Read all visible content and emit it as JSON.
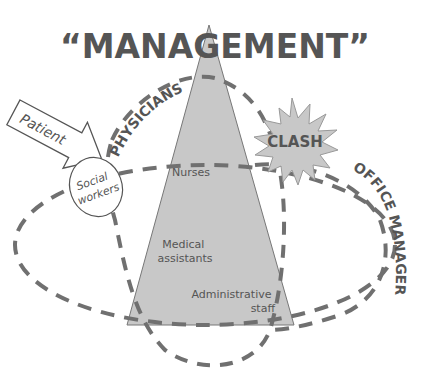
{
  "diagram": {
    "title": "“MANAGEMENT”",
    "pyramid": {
      "levels": [
        "Nurses",
        "Medical assistants",
        "Administrative staff"
      ],
      "level_lines": [
        [
          "Nurses"
        ],
        [
          "Medical",
          "assistants"
        ],
        [
          "Administrative",
          "staff"
        ]
      ],
      "fill": "#c8c8c8"
    },
    "groups": {
      "physicians": "PHYSICIANS",
      "office_managers": "OFFICE MANAGERS",
      "social_workers_line1": "Social",
      "social_workers_line2": "workers"
    },
    "arrow_label": "Patient",
    "burst_label": "CLASH",
    "colors": {
      "dash": "#707070",
      "text": "#555555",
      "burst": "#c8c8c8"
    }
  }
}
